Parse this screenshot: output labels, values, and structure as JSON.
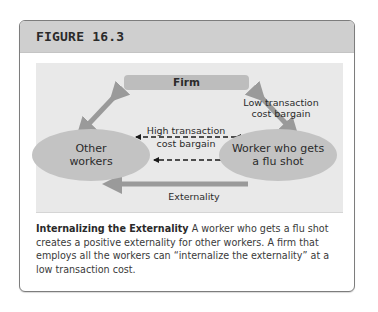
{
  "figure": {
    "title": "FIGURE 16.3",
    "diagram": {
      "nodes": {
        "firm": "Firm",
        "other_workers_line1": "Other",
        "other_workers_line2": "workers",
        "worker_line1": "Worker who gets",
        "worker_line2": "a flu shot"
      },
      "edges": {
        "low_line1": "Low transaction",
        "low_line2": "cost bargain",
        "high_line1": "High transaction",
        "high_line2": "cost bargain",
        "externality": "Externality"
      },
      "colors": {
        "node_fill": "#c3c3c3",
        "arrow": "#9a9a9a",
        "background": "#e9e9e9"
      }
    },
    "caption": {
      "bold_title": "Internalizing the Externality",
      "text": " A worker who gets a flu shot creates a positive externality for other workers. A firm that employs all the workers can “internalize the externality” at a low transaction cost."
    }
  }
}
